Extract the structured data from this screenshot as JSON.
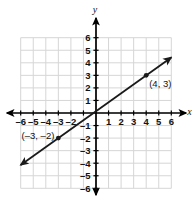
{
  "chart_data": {
    "type": "line",
    "title": "",
    "xlabel": "x",
    "ylabel": "y",
    "xlim": [
      -6,
      6
    ],
    "ylim": [
      -6,
      6
    ],
    "grid": true,
    "legend": "none",
    "x_ticks": [
      "-6",
      "-5",
      "-4",
      "-3",
      "-2",
      "1",
      "2",
      "3",
      "4",
      "5",
      "6"
    ],
    "y_ticks": [
      "6",
      "5",
      "4",
      "3",
      "2",
      "1",
      "-1",
      "-2",
      "-3",
      "-4",
      "-5",
      "-6"
    ],
    "series": [
      {
        "name": "line",
        "slope": 0.714,
        "intercept": 0.143,
        "x": [
          -6,
          6
        ],
        "y": [
          -4.14,
          4.43
        ],
        "arrow_start": true,
        "arrow_end": true
      }
    ],
    "points": [
      {
        "x": 4,
        "y": 3,
        "label": "(4, 3)"
      },
      {
        "x": -3,
        "y": -2,
        "label": "(–3, –2)"
      }
    ]
  },
  "axes": {
    "x_axis_label": "x",
    "y_axis_label": "y",
    "x_tick_values": [
      {
        "value": -6,
        "text": "–6"
      },
      {
        "value": -5,
        "text": "–5"
      },
      {
        "value": -4,
        "text": "–4"
      },
      {
        "value": -3,
        "text": "–3"
      },
      {
        "value": -2,
        "text": "–2"
      },
      {
        "value": 1,
        "text": "1"
      },
      {
        "value": 2,
        "text": "2"
      },
      {
        "value": 3,
        "text": "3"
      },
      {
        "value": 4,
        "text": "4"
      },
      {
        "value": 5,
        "text": "5"
      },
      {
        "value": 6,
        "text": "6"
      }
    ],
    "y_tick_values": [
      {
        "value": 6,
        "text": "6"
      },
      {
        "value": 5,
        "text": "5"
      },
      {
        "value": 4,
        "text": "4"
      },
      {
        "value": 3,
        "text": "3"
      },
      {
        "value": 2,
        "text": "2"
      },
      {
        "value": 1,
        "text": "1"
      },
      {
        "value": -1,
        "text": "–1"
      },
      {
        "value": -2,
        "text": "–2"
      },
      {
        "value": -3,
        "text": "–3"
      },
      {
        "value": -4,
        "text": "–4"
      },
      {
        "value": -5,
        "text": "–5"
      },
      {
        "value": -6,
        "text": "–6"
      }
    ]
  },
  "annotations": {
    "point_a_label": "(4, 3)",
    "point_b_label": "(–3, –2)"
  },
  "colors": {
    "grid": "#d6d6d6",
    "axis": "#000000",
    "line": "#1a1a1a",
    "text": "#111111",
    "background": "#ffffff"
  }
}
